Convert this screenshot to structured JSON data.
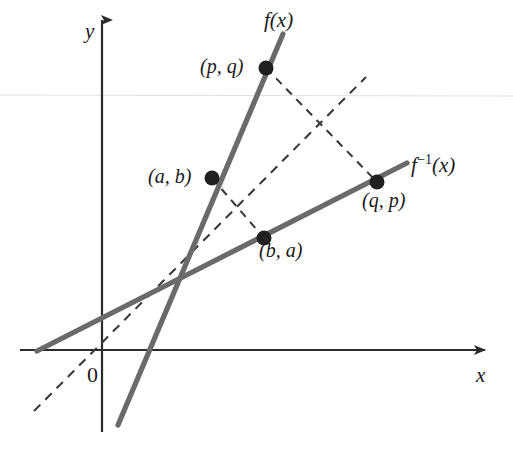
{
  "figure": {
    "background_color": "#ffffff",
    "line_color": "#6a6a6a",
    "dash_color": "#3a3a3a",
    "axis_color": "#2b2b2b",
    "text_color": "#1a1a1a",
    "width": 513,
    "height": 457
  },
  "axes": {
    "x_label": "x",
    "y_label": "y",
    "origin_label": "0",
    "x_axis": {
      "x1": 20,
      "y1": 350,
      "x2": 485,
      "y2": 350
    },
    "y_axis": {
      "x1": 102,
      "y1": 20,
      "x2": 102,
      "y2": 432
    }
  },
  "curves": [
    {
      "name": "f",
      "label": "f(x)",
      "label_x": 264,
      "label_y": 10,
      "style": "solid",
      "x1": 118,
      "y1": 425,
      "x2": 283,
      "y2": 34
    },
    {
      "name": "f-inverse",
      "label_base": "f",
      "label_exponent": "−1",
      "label_arg": "(x)",
      "label_x": 411,
      "label_y": 152,
      "style": "solid",
      "x1": 37,
      "y1": 351,
      "x2": 407,
      "y2": 163
    },
    {
      "name": "identity",
      "label": "y = x",
      "style": "dashed",
      "x1": 34,
      "y1": 411,
      "x2": 366,
      "y2": 77
    }
  ],
  "connectors": [
    {
      "name": "ab-to-ba",
      "style": "dashed",
      "x1": 212,
      "y1": 178,
      "x2": 264,
      "y2": 238
    },
    {
      "name": "pq-to-qp",
      "style": "dashed",
      "x1": 266,
      "y1": 68,
      "x2": 377,
      "y2": 182
    }
  ],
  "points": [
    {
      "name": "a-b",
      "label": "(a, b)",
      "cx": 212,
      "cy": 178,
      "label_x": 148,
      "label_y": 166
    },
    {
      "name": "p-q",
      "label": "(p, q)",
      "cx": 266,
      "cy": 68,
      "label_x": 200,
      "label_y": 56
    },
    {
      "name": "b-a",
      "label": "(b, a)",
      "cx": 264,
      "cy": 238,
      "label_x": 259,
      "label_y": 240
    },
    {
      "name": "q-p",
      "label": "(q, p)",
      "cx": 377,
      "cy": 182,
      "label_x": 362,
      "label_y": 190
    }
  ],
  "artifact": {
    "name": "scan-line",
    "y": 95,
    "color": "#e2e2e2"
  }
}
